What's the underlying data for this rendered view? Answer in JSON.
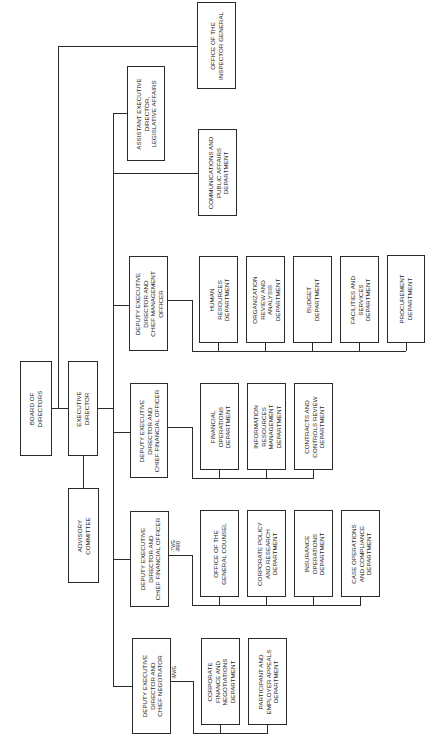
{
  "diagram": {
    "orientation": "rotated-90-ccw",
    "boxes": {
      "board": "BOARD OF\nDIRECTORS",
      "executive_director": "EXECUTIVE\nDIRECTOR",
      "advisory": "ADVISORY\nCOMMITTEE",
      "inspector_general": "OFFICE OF THE\nINSPECTOR GENERAL",
      "asst_ed": "ASSISTANT EXECUTIVE\nDIRECTOR,\nLEGISLATIVE AFFAIRS",
      "comms": "COMMUNICATIONS AND\nPUBLIC AFFAIRS\nDEPARTMENT",
      "cmo": "DEPUTY EXECUTIVE\nDIRECTOR AND\nCHIEF MANAGEMENT\nOFFICER",
      "cfo": "DEPUTY EXECUTIVE\nDIRECTOR AND\nCHIEF FINANCIAL OFFICER",
      "cfo2": "DEPUTY EXECUTIVE\nDIRECTOR AND\nCHIEF FINANCIAL OFFICER",
      "negotiator": "DEPUTY EXECUTIVE\nDIRECTOR AND\nCHIEF NEGOTIATOR"
    },
    "cmo_departments": [
      "HUMAN\nRESOURCES\nDEPARTMENT",
      "ORGANIZATION\nREVIEW AND\nANALYSIS\nDEPARTMENT",
      "BUDGET\nDEPARTMENT",
      "FACILITIES AND\nSERVICES\nDEPARTMENT",
      "PROCUREMENT\nDEPARTMENT"
    ],
    "cfo_departments": [
      "FINANCIAL\nOPERATIONS\nDEPARTMENT",
      "INFORMATION\nRESOURCES\nMANAGEMENT\nDEPARTMENT",
      "CONTRACTS AND\nCONTROLS REVIEW\nDEPARTMENT"
    ],
    "cfo2_departments": [
      "OFFICE OF THE\nGENERAL COUNSEL",
      "CORPORATE POLICY\nAND RESEARCH\nDEPARTMENT",
      "INSURANCE\nOPERATIONS\nDEPARTMENT",
      "CASE OPERATIONS\nAND COMPLIANCE\nDEPARTMENT"
    ],
    "negotiator_departments": [
      "CORPORATE\nFINANCE AND\nNEGOTIATIONS\nDEPARTMENT",
      "PARTICIPANT AND\nEMPLOYER APPEALS\nDEPARTMENT"
    ],
    "annotations": {
      "cfo2_note": "-TWG\n-PRO",
      "negotiator_note": "-MWG"
    }
  }
}
